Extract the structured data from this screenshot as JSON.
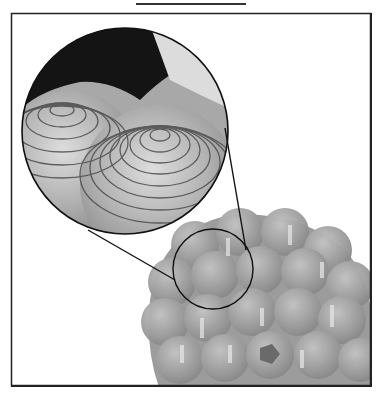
{
  "figure": {
    "inset": {
      "cx": 125,
      "cy": 131,
      "r": 103
    },
    "source": {
      "cx": 213,
      "cy": 269,
      "r": 40
    },
    "colors": {
      "frame": "#222222",
      "cluster": "#9a9a9a",
      "highlight": "#d8d8d8",
      "dark": "#111111",
      "background": "#ffffff"
    }
  }
}
